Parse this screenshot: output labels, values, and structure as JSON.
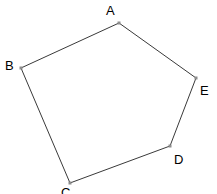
{
  "figure": {
    "name": "pentagon-abcde",
    "type": "polygon",
    "canvas": {
      "width": 217,
      "height": 194
    },
    "style": {
      "background_color": "#ffffff",
      "edge_color": "#3a3a3a",
      "edge_width": 1,
      "vertex_marker_color": "#8c8c8c",
      "vertex_marker_size": 3,
      "label_color": "#000000",
      "label_font_size": 13
    },
    "vertices": [
      {
        "id": "A",
        "label": "A",
        "x": 119,
        "y": 23,
        "label_x": 106,
        "label_y": 4
      },
      {
        "id": "B",
        "label": "B",
        "x": 21,
        "y": 68,
        "label_x": 5,
        "label_y": 59
      },
      {
        "id": "C",
        "label": "C",
        "x": 70,
        "y": 183,
        "label_x": 61,
        "label_y": 186
      },
      {
        "id": "D",
        "label": "D",
        "x": 170,
        "y": 146,
        "label_x": 174,
        "label_y": 153
      },
      {
        "id": "E",
        "label": "E",
        "x": 196,
        "y": 78,
        "label_x": 200,
        "label_y": 84
      }
    ],
    "edges": [
      {
        "from": "A",
        "to": "B"
      },
      {
        "from": "B",
        "to": "C"
      },
      {
        "from": "C",
        "to": "D"
      },
      {
        "from": "D",
        "to": "E"
      },
      {
        "from": "E",
        "to": "A"
      }
    ]
  }
}
